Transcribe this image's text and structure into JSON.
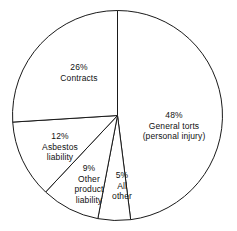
{
  "chart_data": {
    "type": "pie",
    "title": "",
    "subtitle": "",
    "xlabel": "",
    "ylabel": "",
    "legend_position": "none",
    "grid": false,
    "labels_inside": true,
    "total_percent": 100,
    "start_angle_deg": 0,
    "direction": "clockwise",
    "categories": [
      "General torts (personal injury)",
      "All other",
      "Other product liability",
      "Asbestos liability",
      "Contracts"
    ],
    "values": [
      48,
      5,
      9,
      12,
      26
    ],
    "slices": [
      {
        "name": "general-torts",
        "percent_text": "48%",
        "value": 48,
        "label_lines": [
          "48%",
          "General torts",
          "(personal injury)"
        ],
        "start_deg": 0,
        "end_deg": 172.8,
        "label_x": 174,
        "label_y": 126
      },
      {
        "name": "all-other",
        "percent_text": "5%",
        "value": 5,
        "label_lines": [
          "5%",
          "All",
          "other"
        ],
        "start_deg": 172.8,
        "end_deg": 190.8,
        "label_x": 122,
        "label_y": 186
      },
      {
        "name": "other-product-liability",
        "percent_text": "9%",
        "value": 9,
        "label_lines": [
          "9%",
          "Other",
          "product",
          "liability"
        ],
        "start_deg": 190.8,
        "end_deg": 223.2,
        "label_x": 89,
        "label_y": 184
      },
      {
        "name": "asbestos-liability",
        "percent_text": "12%",
        "value": 12,
        "label_lines": [
          "12%",
          "Asbestos",
          "liability"
        ],
        "start_deg": 223.2,
        "end_deg": 266.4,
        "label_x": 60,
        "label_y": 147
      },
      {
        "name": "contracts",
        "percent_text": "26%",
        "value": 26,
        "label_lines": [
          "26%",
          "Contracts"
        ],
        "start_deg": 266.4,
        "end_deg": 360,
        "label_x": 79,
        "label_y": 72
      }
    ],
    "geometry": {
      "center_x": 117.5,
      "center_y": 115.5,
      "radius": 105
    },
    "colors": {
      "slice_fill": "#ffffff",
      "slice_stroke": "#1a1a1a",
      "background": "#ffffff",
      "text": "#111111"
    }
  }
}
